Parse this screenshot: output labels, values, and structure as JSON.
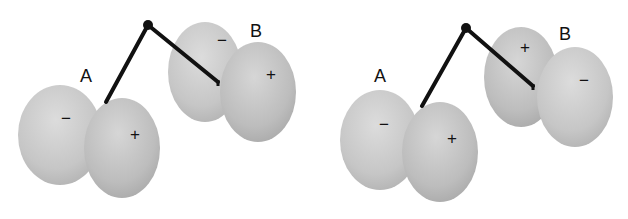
{
  "colors": {
    "background": "#ffffff",
    "lobe_light": "#d2d2d2",
    "lobe_mid": "#bdbdbd",
    "lobe_dark": "#a8a8a8",
    "bond": "#111111"
  },
  "panels": [
    {
      "id": "left",
      "atom_a": {
        "label": "A",
        "left_lobe_sign": "−",
        "right_lobe_sign": "+"
      },
      "atom_b": {
        "label": "B",
        "back_lobe_sign": "−",
        "front_lobe_sign": "+"
      }
    },
    {
      "id": "right",
      "atom_a": {
        "label": "A",
        "left_lobe_sign": "−",
        "right_lobe_sign": "+"
      },
      "atom_b": {
        "label": "B",
        "back_lobe_sign": "+",
        "front_lobe_sign": "−"
      }
    }
  ]
}
